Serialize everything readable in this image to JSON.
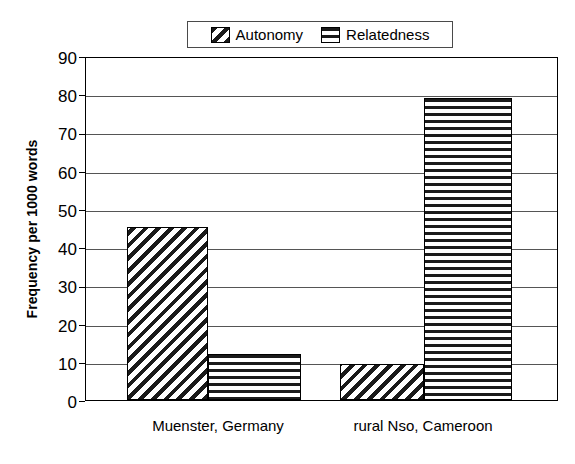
{
  "chart_data": {
    "type": "bar",
    "title": "",
    "xlabel": "",
    "ylabel": "Frequency per 1000 words",
    "categories": [
      "Muenster, Germany",
      "rural Nso, Cameroon"
    ],
    "series": [
      {
        "name": "Autonomy",
        "pattern": "diagonal-hatch",
        "values": [
          45.4,
          9.5
        ]
      },
      {
        "name": "Relatedness",
        "pattern": "horizontal-hatch",
        "values": [
          12.2,
          79.6
        ]
      }
    ],
    "ylim": [
      0,
      90
    ],
    "yticks": [
      0,
      10,
      20,
      30,
      40,
      50,
      60,
      70,
      80,
      90
    ],
    "ytick_labels": [
      "0",
      "10",
      "20",
      "30",
      "40",
      "50",
      "60",
      "70",
      "80",
      "90"
    ],
    "grid": true,
    "grid_axis": "y",
    "legend_position": "top-center",
    "legend": [
      "Autonomy",
      "Relatedness"
    ],
    "colors": {
      "axis": "#000000",
      "grid": "#555555",
      "hatch": "#1a1a1a",
      "background": "#ffffff"
    }
  },
  "legend": {
    "items": [
      {
        "label": "Autonomy",
        "icon": "diagonal-hatch-swatch"
      },
      {
        "label": "Relatedness",
        "icon": "horizontal-hatch-swatch"
      }
    ]
  },
  "axes": {
    "y_title": "Frequency per 1000 words",
    "y_ticks": [
      "90",
      "80",
      "70",
      "60",
      "50",
      "40",
      "30",
      "20",
      "10",
      "0"
    ],
    "x_categories": [
      "Muenster, Germany",
      "rural Nso, Cameroon"
    ]
  }
}
